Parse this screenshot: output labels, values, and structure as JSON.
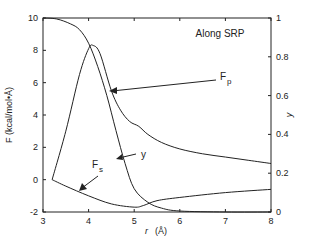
{
  "chart_data": {
    "type": "line",
    "title": "",
    "annotation_title": "Along SRP",
    "xlabel": "r (Å)",
    "ylabel": "F (kcal/mol•Å)",
    "y2label": "y",
    "xlim": [
      3,
      8
    ],
    "ylim": [
      -2,
      10
    ],
    "y2lim": [
      0,
      1
    ],
    "grid": false,
    "x_ticks": [
      3,
      4,
      5,
      6,
      7,
      8
    ],
    "y_ticks": [
      -2,
      0,
      2,
      4,
      6,
      8,
      10
    ],
    "y2_ticks": [
      "0",
      "0.2",
      "0.4",
      "0.6",
      "0.8",
      "1"
    ],
    "series": [
      {
        "name": "Fp",
        "axis": "left",
        "x": [
          3.2,
          3.5,
          3.8,
          4.0,
          4.1,
          4.25,
          4.5,
          4.7,
          4.9,
          5.1,
          5.3,
          5.6,
          6.0,
          6.5,
          7.0,
          7.5,
          8.0
        ],
        "values": [
          0,
          3.0,
          6.5,
          8.1,
          8.3,
          7.8,
          5.5,
          4.3,
          3.6,
          3.3,
          2.8,
          2.3,
          1.9,
          1.6,
          1.4,
          1.2,
          1.0
        ]
      },
      {
        "name": "Fs",
        "axis": "left",
        "x": [
          3.2,
          3.5,
          4.0,
          4.5,
          5.0,
          5.2,
          5.5,
          6.0,
          7.0,
          8.0
        ],
        "values": [
          0,
          -0.4,
          -1.0,
          -1.5,
          -1.7,
          -1.6,
          -1.3,
          -1.1,
          -0.8,
          -0.6
        ]
      },
      {
        "name": "y",
        "axis": "right",
        "x": [
          3.0,
          3.3,
          3.6,
          3.8,
          4.0,
          4.2,
          4.4,
          4.6,
          4.8,
          5.0,
          5.3,
          5.6,
          6.0,
          7.0,
          8.0
        ],
        "values": [
          1.0,
          0.995,
          0.97,
          0.94,
          0.87,
          0.75,
          0.6,
          0.42,
          0.25,
          0.12,
          0.05,
          0.02,
          0.005,
          0,
          0
        ]
      }
    ],
    "annotations": [
      {
        "text": "Fp",
        "points_to": "Fp"
      },
      {
        "text": "Fs",
        "points_to": "Fs"
      },
      {
        "text": "y",
        "points_to": "y"
      }
    ]
  },
  "labels": {
    "title": "Along SRP",
    "xlabel_r": "r",
    "xlabel_unit": "(Å)",
    "ylabel": "F (kcal/mol•Å)",
    "y2label": "y",
    "fp_main": "F",
    "fp_sub": "p",
    "fs_main": "F",
    "fs_sub": "s",
    "y_label": "y"
  }
}
